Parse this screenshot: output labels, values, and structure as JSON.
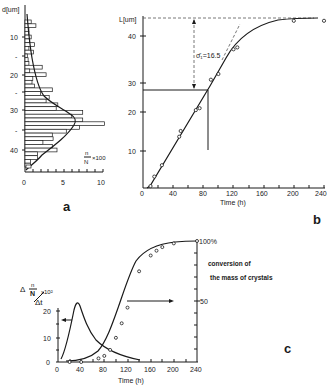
{
  "panels": {
    "a": {
      "label": "a",
      "ylabel": "d[um]",
      "xlabel_num": "n",
      "xlabel_den": "N",
      "xlabel_mult": "×100",
      "yticks": [
        "10",
        "-",
        "20",
        "-",
        "30",
        "-",
        "40"
      ],
      "xticks": [
        "0",
        "5",
        "10"
      ]
    },
    "b": {
      "label": "b",
      "ylabel": "L[um]",
      "xlabel": "Time (h)",
      "annotation": "σ̄₁=16.5",
      "yticks": [
        "10",
        "20",
        "30",
        "40"
      ],
      "xticks": [
        "0",
        "40",
        "80",
        "120",
        "160",
        "200",
        "240"
      ]
    },
    "c": {
      "label": "c",
      "ylabel_left_num": "n",
      "ylabel_left_den": "N",
      "ylabel_left_delta": "Δ",
      "ylabel_left_dt": "Δt",
      "ylabel_left_mult": "x10²",
      "right_top": "100%",
      "right_mid": "50",
      "right_title_1": "conversion of",
      "right_title_2": "the mass of crystals",
      "xlabel": "Time (h)",
      "yticks_left": [
        "0",
        "10",
        "20"
      ],
      "xticks": [
        "0",
        "40",
        "80",
        "120",
        "160",
        "200",
        "240"
      ]
    }
  },
  "chart_data": [
    {
      "panel": "a",
      "type": "bar",
      "orientation": "horizontal",
      "title": "",
      "ylabel": "d [um]",
      "xlabel": "n/N ×100",
      "xlim": [
        0,
        10
      ],
      "ylim": [
        0,
        45
      ],
      "categories": [
        6,
        7,
        8,
        9,
        10,
        11,
        12,
        13,
        14,
        15,
        16,
        17,
        18,
        19,
        20,
        21,
        22,
        23,
        24,
        25,
        26,
        27,
        28,
        29,
        30,
        31,
        32,
        33,
        34,
        35,
        36,
        37,
        38,
        39,
        40,
        41,
        42,
        43,
        44
      ],
      "values": [
        0.8,
        1.4,
        0.5,
        0.5,
        0.8,
        0.6,
        1.2,
        0.5,
        1.1,
        0.3,
        0.4,
        0.5,
        2.2,
        0.6,
        2.7,
        1.0,
        0.9,
        1.2,
        3.5,
        2.0,
        3.1,
        2.7,
        4.2,
        4.0,
        7.4,
        6.0,
        7.4,
        10.2,
        7.0,
        5.3,
        3.5,
        3.6,
        2.3,
        3.5,
        4.1,
        1.6,
        1.6,
        0.7,
        0.7
      ],
      "series": [
        {
          "name": "distribution fit",
          "type": "line",
          "x": [
            0.3,
            0.6,
            1.0,
            1.6,
            2.4,
            3.6,
            5.4,
            7.3,
            7.9,
            7.2,
            5.3,
            3.4,
            2.0,
            1.0,
            0.2
          ],
          "y": [
            6,
            10,
            15,
            20,
            24,
            27,
            29,
            31,
            33,
            34,
            36,
            38,
            40,
            42,
            44
          ]
        }
      ]
    },
    {
      "panel": "b",
      "type": "line",
      "title": "",
      "xlabel": "Time (h)",
      "ylabel": "L [um]",
      "xlim": [
        0,
        240
      ],
      "ylim": [
        0,
        45
      ],
      "series": [
        {
          "name": "crystal size L",
          "x": [
            10,
            15,
            25,
            48,
            50,
            70,
            75,
            90,
            100,
            120,
            125,
            200,
            240
          ],
          "y": [
            0.5,
            3,
            6,
            13.5,
            15,
            20.5,
            21,
            28.5,
            30,
            36.5,
            37,
            44,
            44
          ]
        }
      ],
      "annotations": [
        "σ̄₁=16.5",
        "dashed asymptote L≈44.5",
        "reference L=28 at t=88"
      ]
    },
    {
      "panel": "c",
      "type": "line",
      "title": "",
      "xlabel": "Time (h)",
      "ylabel_left": "Δ(n/N)/Δt ×10²",
      "ylabel_right": "conversion of the mass of crystals (%)",
      "xlim": [
        0,
        240
      ],
      "ylim_left": [
        0,
        27
      ],
      "ylim_right": [
        0,
        100
      ],
      "series": [
        {
          "name": "nucleation rate (left axis)",
          "x": [
            5,
            20,
            30,
            37,
            42,
            50,
            60,
            80,
            100,
            120
          ],
          "y": [
            0.5,
            8,
            20,
            25,
            21,
            12,
            7,
            3.5,
            1.5,
            0.5
          ]
        },
        {
          "name": "conversion % (right axis)",
          "x": [
            20,
            40,
            70,
            80,
            90,
            100,
            110,
            120,
            140,
            160,
            170,
            180,
            200,
            240
          ],
          "y": [
            0,
            0,
            3,
            5,
            10,
            20,
            32,
            45,
            75,
            88,
            92,
            95,
            98,
            100
          ]
        }
      ]
    }
  ]
}
